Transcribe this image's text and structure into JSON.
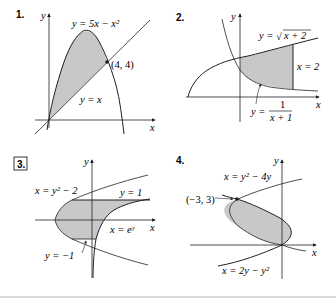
{
  "panels": [
    {
      "number": "1.",
      "boxed": false,
      "axes": {
        "x": "x",
        "y": "y"
      },
      "labels": {
        "curve": "y = 5x − x²",
        "line": "y = x",
        "point": "(4, 4)"
      }
    },
    {
      "number": "2.",
      "boxed": false,
      "axes": {
        "x": "x",
        "y": "y"
      },
      "labels": {
        "upper": "y = √x + 2",
        "upper_radicand": "x + 2",
        "upper_prefix": "y =",
        "right": "x = 2",
        "lower_prefix": "y =",
        "lower_num": "1",
        "lower_den": "x + 1"
      }
    },
    {
      "number": "3.",
      "boxed": true,
      "axes": {
        "x": "x",
        "y": "y"
      },
      "labels": {
        "parabola": "x = y² − 2",
        "top": "y = 1",
        "exp": "x = eʸ",
        "bottom": "y = −1"
      }
    },
    {
      "number": "4.",
      "boxed": false,
      "axes": {
        "x": "x",
        "y": "y"
      },
      "labels": {
        "upper": "x = y² − 4y",
        "point": "(−3, 3)",
        "lower": "x = 2y − y²"
      }
    }
  ],
  "colors": {
    "ink": "#231f20",
    "shade": "#c8c8c8",
    "rule": "#b0b0b0"
  }
}
